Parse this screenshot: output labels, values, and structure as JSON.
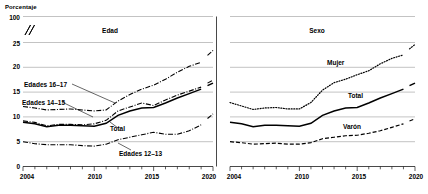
{
  "chart_data": {
    "type": "line",
    "title": "",
    "ylabel": "Porcentaje",
    "xlabel": "",
    "ylim": [
      0,
      25
    ],
    "yticks": [
      0,
      5,
      10,
      15,
      20,
      25,
      100
    ],
    "ytick_labels": [
      "0",
      "5",
      "10",
      "15",
      "20",
      "25",
      "100"
    ],
    "axis_break": true,
    "axis_break_between": [
      25,
      100
    ],
    "xlim": [
      2004,
      2020
    ],
    "xticks": [
      2004,
      2005,
      2006,
      2007,
      2008,
      2009,
      2010,
      2011,
      2012,
      2013,
      2014,
      2015,
      2016,
      2017,
      2018,
      2019,
      2020
    ],
    "xtick_labels": [
      "2004",
      "2010",
      "2015",
      "2020"
    ],
    "xtick_label_values": [
      2004,
      2010,
      2015,
      2020
    ],
    "grid": true,
    "legend": "inline-annotations",
    "panels": [
      {
        "name": "edad-panel",
        "title": "Edad",
        "series": [
          {
            "name": "Edades 16-17",
            "label": "Edades 16–17",
            "style": "dash-dot",
            "x": [
              2004,
              2005,
              2006,
              2007,
              2008,
              2009,
              2010,
              2011,
              2012,
              2013,
              2014,
              2015,
              2016,
              2017,
              2018,
              2019,
              2020
            ],
            "values": [
              12.1,
              11.8,
              11.4,
              11.5,
              11.6,
              11.4,
              11.2,
              11.4,
              13.2,
              14.5,
              15.6,
              16.4,
              17.6,
              19.0,
              20.2,
              21.0,
              23.4
            ]
          },
          {
            "name": "Edades 14-15",
            "label": "Edades 14–15",
            "style": "dash-dot",
            "x": [
              2004,
              2005,
              2006,
              2007,
              2008,
              2009,
              2010,
              2011,
              2012,
              2013,
              2014,
              2015,
              2016,
              2017,
              2018,
              2019,
              2020
            ],
            "values": [
              9.2,
              8.9,
              8.2,
              8.5,
              8.5,
              8.4,
              8.6,
              9.3,
              11.2,
              12.0,
              12.8,
              12.3,
              13.4,
              14.4,
              15.2,
              16.0,
              17.4
            ]
          },
          {
            "name": "Total",
            "label": "Total",
            "style": "solid",
            "x": [
              2004,
              2005,
              2006,
              2007,
              2008,
              2009,
              2010,
              2011,
              2012,
              2013,
              2014,
              2015,
              2016,
              2017,
              2018,
              2019,
              2020
            ],
            "values": [
              8.9,
              8.6,
              8.0,
              8.3,
              8.3,
              8.2,
              8.1,
              8.7,
              10.3,
              11.2,
              11.8,
              11.9,
              12.8,
              13.8,
              14.7,
              15.6,
              16.8
            ]
          },
          {
            "name": "Edades 12-13",
            "label": "Edades 12–13",
            "style": "dash-dot",
            "x": [
              2004,
              2005,
              2006,
              2007,
              2008,
              2009,
              2010,
              2011,
              2012,
              2013,
              2014,
              2015,
              2016,
              2017,
              2018,
              2019,
              2020
            ],
            "values": [
              5.0,
              4.6,
              4.4,
              4.4,
              4.4,
              4.2,
              4.1,
              4.5,
              5.4,
              5.9,
              6.4,
              6.9,
              6.5,
              6.5,
              7.2,
              8.4,
              10.6
            ]
          }
        ]
      },
      {
        "name": "sexo-panel",
        "title": "Sexo",
        "series": [
          {
            "name": "Mujer",
            "label": "Mujer",
            "style": "dotted",
            "x": [
              2004,
              2005,
              2006,
              2007,
              2008,
              2009,
              2010,
              2011,
              2012,
              2013,
              2014,
              2015,
              2016,
              2017,
              2018,
              2019,
              2020
            ],
            "values": [
              12.9,
              12.2,
              11.5,
              11.8,
              11.9,
              11.6,
              11.6,
              12.9,
              15.4,
              16.9,
              17.6,
              18.5,
              19.3,
              20.7,
              21.8,
              22.5,
              24.6
            ]
          },
          {
            "name": "Total",
            "label": "Total",
            "style": "solid",
            "x": [
              2004,
              2005,
              2006,
              2007,
              2008,
              2009,
              2010,
              2011,
              2012,
              2013,
              2014,
              2015,
              2016,
              2017,
              2018,
              2019,
              2020
            ],
            "values": [
              8.9,
              8.6,
              8.0,
              8.3,
              8.3,
              8.2,
              8.1,
              8.7,
              10.3,
              11.2,
              11.8,
              11.9,
              12.8,
              13.8,
              14.7,
              15.6,
              16.8
            ]
          },
          {
            "name": "Varon",
            "label": "Varón",
            "style": "dashed",
            "x": [
              2004,
              2005,
              2006,
              2007,
              2008,
              2009,
              2010,
              2011,
              2012,
              2013,
              2014,
              2015,
              2016,
              2017,
              2018,
              2019,
              2020
            ],
            "values": [
              5.0,
              4.8,
              4.5,
              4.6,
              4.7,
              4.5,
              4.5,
              4.8,
              5.6,
              5.9,
              6.2,
              6.3,
              6.7,
              7.2,
              7.9,
              8.6,
              9.6
            ]
          }
        ]
      }
    ]
  },
  "axis": {
    "ylabel": "Porcentaje",
    "yticks": [
      "100",
      "25",
      "20",
      "15",
      "10",
      "5",
      "0"
    ],
    "xticks_left": [
      "2004",
      "2010",
      "2015",
      "2020"
    ],
    "xticks_right": [
      "2004",
      "2010",
      "2015",
      "2020"
    ]
  },
  "panels": {
    "left": {
      "title": "Edad",
      "labels": {
        "s1": "Edades 16–17",
        "s2": "Edades 14–15",
        "s3": "Total",
        "s4": "Edades 12–13"
      }
    },
    "right": {
      "title": "Sexo",
      "labels": {
        "s1": "Mujer",
        "s2": "Total",
        "s3": "Varón"
      }
    }
  }
}
